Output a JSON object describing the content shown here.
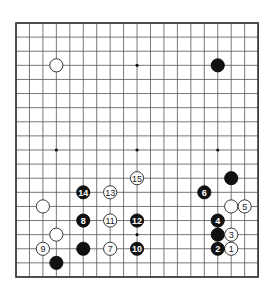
{
  "board": {
    "size": 19,
    "origin_x": 16,
    "origin_y": 23,
    "spacing_x": 13.45,
    "spacing_y": 14.11,
    "stone_radius": 6.6,
    "colors": {
      "background": "#ffffff",
      "grid": "#555555",
      "black_stone": "#111111",
      "white_stone": "#ffffff",
      "stone_outline": "#222222"
    },
    "hoshi": [
      [
        3,
        3
      ],
      [
        9,
        3
      ],
      [
        15,
        3
      ],
      [
        3,
        9
      ],
      [
        9,
        9
      ],
      [
        15,
        9
      ],
      [
        3,
        15
      ],
      [
        9,
        15
      ],
      [
        15,
        15
      ]
    ]
  },
  "stones": [
    {
      "color": "white",
      "col": 3,
      "row": 3,
      "label": ""
    },
    {
      "color": "black",
      "col": 15,
      "row": 3,
      "label": ""
    },
    {
      "color": "black",
      "col": 16,
      "row": 11,
      "label": ""
    },
    {
      "color": "white",
      "col": 2,
      "row": 13,
      "label": ""
    },
    {
      "color": "white",
      "col": 16,
      "row": 13,
      "label": ""
    },
    {
      "color": "black",
      "col": 15,
      "row": 15,
      "label": ""
    },
    {
      "color": "white",
      "col": 3,
      "row": 15,
      "label": ""
    },
    {
      "color": "black",
      "col": 5,
      "row": 16,
      "label": ""
    },
    {
      "color": "black",
      "col": 3,
      "row": 17,
      "label": ""
    },
    {
      "color": "white",
      "col": 16,
      "row": 16,
      "label": "1"
    },
    {
      "color": "black",
      "col": 15,
      "row": 16,
      "label": "2"
    },
    {
      "color": "white",
      "col": 16,
      "row": 15,
      "label": "3"
    },
    {
      "color": "black",
      "col": 15,
      "row": 14,
      "label": "4"
    },
    {
      "color": "white",
      "col": 17,
      "row": 13,
      "label": "5"
    },
    {
      "color": "black",
      "col": 14,
      "row": 12,
      "label": "6"
    },
    {
      "color": "white",
      "col": 7,
      "row": 16,
      "label": "7"
    },
    {
      "color": "black",
      "col": 5,
      "row": 14,
      "label": "8"
    },
    {
      "color": "white",
      "col": 2,
      "row": 16,
      "label": "9"
    },
    {
      "color": "black",
      "col": 9,
      "row": 16,
      "label": "10"
    },
    {
      "color": "white",
      "col": 7,
      "row": 14,
      "label": "11"
    },
    {
      "color": "black",
      "col": 9,
      "row": 14,
      "label": "12"
    },
    {
      "color": "white",
      "col": 7,
      "row": 12,
      "label": "13"
    },
    {
      "color": "black",
      "col": 5,
      "row": 12,
      "label": "14"
    },
    {
      "color": "white",
      "col": 9,
      "row": 11,
      "label": "15"
    }
  ]
}
